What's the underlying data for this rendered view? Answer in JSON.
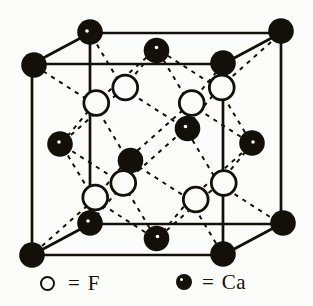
{
  "figure": {
    "name": "fluorite-CaF2-unit-cell",
    "background": "#fcfcfa",
    "ink": "#131009",
    "projection": {
      "origin_x": 32,
      "origin_y": 255,
      "edge": 191,
      "depth_dx": 58,
      "depth_dy": -31
    },
    "cube": {
      "stroke_width": 2.7,
      "edges": [
        [
          [
            0,
            0,
            0
          ],
          [
            1,
            0,
            0
          ]
        ],
        [
          [
            0,
            1,
            0
          ],
          [
            1,
            1,
            0
          ]
        ],
        [
          [
            0,
            0,
            0
          ],
          [
            0,
            1,
            0
          ]
        ],
        [
          [
            1,
            0,
            0
          ],
          [
            1,
            1,
            0
          ]
        ],
        [
          [
            0,
            0,
            1
          ],
          [
            1,
            0,
            1
          ]
        ],
        [
          [
            0,
            1,
            1
          ],
          [
            1,
            1,
            1
          ]
        ],
        [
          [
            0,
            0,
            1
          ],
          [
            0,
            1,
            1
          ]
        ],
        [
          [
            1,
            0,
            1
          ],
          [
            1,
            1,
            1
          ]
        ],
        [
          [
            0,
            0,
            0
          ],
          [
            0,
            0,
            1
          ]
        ],
        [
          [
            1,
            0,
            0
          ],
          [
            1,
            0,
            1
          ]
        ],
        [
          [
            0,
            1,
            0
          ],
          [
            0,
            1,
            1
          ]
        ],
        [
          [
            1,
            1,
            0
          ],
          [
            1,
            1,
            1
          ]
        ]
      ]
    },
    "bonds": {
      "stroke_width": 2,
      "dash": "4.2 5.2",
      "pairs": [
        [
          [
            0.25,
            0.25,
            0.25
          ],
          [
            0,
            0,
            0
          ]
        ],
        [
          [
            0.25,
            0.25,
            0.25
          ],
          [
            0.5,
            0.5,
            0
          ]
        ],
        [
          [
            0.25,
            0.25,
            0.25
          ],
          [
            0.5,
            0,
            0.5
          ]
        ],
        [
          [
            0.25,
            0.25,
            0.25
          ],
          [
            0,
            0.5,
            0.5
          ]
        ],
        [
          [
            0.75,
            0.25,
            0.25
          ],
          [
            1,
            0,
            0
          ]
        ],
        [
          [
            0.75,
            0.25,
            0.25
          ],
          [
            0.5,
            0.5,
            0
          ]
        ],
        [
          [
            0.75,
            0.25,
            0.25
          ],
          [
            0.5,
            0,
            0.5
          ]
        ],
        [
          [
            0.75,
            0.25,
            0.25
          ],
          [
            1,
            0.5,
            0.5
          ]
        ],
        [
          [
            0.25,
            0.75,
            0.25
          ],
          [
            0,
            1,
            0
          ]
        ],
        [
          [
            0.25,
            0.75,
            0.25
          ],
          [
            0.5,
            0.5,
            0
          ]
        ],
        [
          [
            0.25,
            0.75,
            0.25
          ],
          [
            0.5,
            1,
            0.5
          ]
        ],
        [
          [
            0.25,
            0.75,
            0.25
          ],
          [
            0,
            0.5,
            0.5
          ]
        ],
        [
          [
            0.75,
            0.75,
            0.25
          ],
          [
            1,
            1,
            0
          ]
        ],
        [
          [
            0.75,
            0.75,
            0.25
          ],
          [
            0.5,
            0.5,
            0
          ]
        ],
        [
          [
            0.75,
            0.75,
            0.25
          ],
          [
            0.5,
            1,
            0.5
          ]
        ],
        [
          [
            0.75,
            0.75,
            0.25
          ],
          [
            1,
            0.5,
            0.5
          ]
        ],
        [
          [
            0.25,
            0.25,
            0.75
          ],
          [
            0,
            0,
            1
          ]
        ],
        [
          [
            0.25,
            0.25,
            0.75
          ],
          [
            0.5,
            0.5,
            1
          ]
        ],
        [
          [
            0.25,
            0.25,
            0.75
          ],
          [
            0.5,
            0,
            0.5
          ]
        ],
        [
          [
            0.25,
            0.25,
            0.75
          ],
          [
            0,
            0.5,
            0.5
          ]
        ],
        [
          [
            0.75,
            0.25,
            0.75
          ],
          [
            1,
            0,
            1
          ]
        ],
        [
          [
            0.75,
            0.25,
            0.75
          ],
          [
            0.5,
            0.5,
            1
          ]
        ],
        [
          [
            0.75,
            0.25,
            0.75
          ],
          [
            0.5,
            0,
            0.5
          ]
        ],
        [
          [
            0.75,
            0.25,
            0.75
          ],
          [
            1,
            0.5,
            0.5
          ]
        ],
        [
          [
            0.25,
            0.75,
            0.75
          ],
          [
            0,
            1,
            1
          ]
        ],
        [
          [
            0.25,
            0.75,
            0.75
          ],
          [
            0.5,
            0.5,
            1
          ]
        ],
        [
          [
            0.25,
            0.75,
            0.75
          ],
          [
            0.5,
            1,
            0.5
          ]
        ],
        [
          [
            0.25,
            0.75,
            0.75
          ],
          [
            0,
            0.5,
            0.5
          ]
        ],
        [
          [
            0.75,
            0.75,
            0.75
          ],
          [
            1,
            1,
            1
          ]
        ],
        [
          [
            0.75,
            0.75,
            0.75
          ],
          [
            0.5,
            0.5,
            1
          ]
        ],
        [
          [
            0.75,
            0.75,
            0.75
          ],
          [
            0.5,
            1,
            0.5
          ]
        ],
        [
          [
            0.75,
            0.75,
            0.75
          ],
          [
            1,
            0.5,
            0.5
          ]
        ]
      ]
    },
    "atoms": {
      "ca": {
        "element": "Ca",
        "style": "filled",
        "radius": 12.8,
        "positions": [
          [
            0,
            0,
            0
          ],
          [
            1,
            0,
            0,
            0,
            -1
          ],
          [
            0,
            1,
            0,
            2,
            1
          ],
          [
            1,
            1,
            0,
            0,
            -1
          ],
          [
            0,
            0,
            1,
            0,
            -1,
            -2,
            -2
          ],
          [
            1,
            0,
            1,
            2,
            -1
          ],
          [
            0,
            1,
            1,
            0,
            -1,
            -3,
            -1
          ],
          [
            1,
            1,
            1,
            0,
            -2
          ],
          [
            0.5,
            0.5,
            0,
            3,
            1
          ],
          [
            0.5,
            0.5,
            1,
            2,
            0,
            -2,
            -2
          ],
          [
            0.5,
            1,
            0.5,
            0,
            2,
            0,
            -3
          ],
          [
            0.5,
            0,
            0.5,
            0,
            -1,
            1,
            -2
          ],
          [
            0,
            0.5,
            0.5,
            -1,
            0,
            -1,
            -2
          ],
          [
            1,
            0.5,
            0.5,
            0,
            -1,
            1,
            -1
          ]
        ]
      },
      "f": {
        "element": "F",
        "style": "open",
        "radius": 12.4,
        "stroke_width": 2.8,
        "positions": [
          [
            0.25,
            0.75,
            0.25,
            2,
            -1
          ],
          [
            0.75,
            0.75,
            0.25,
            2,
            -1
          ],
          [
            0.25,
            0.75,
            0.75,
            2,
            -1
          ],
          [
            0.75,
            0.75,
            0.75,
            3,
            -1
          ],
          [
            0.25,
            0.25,
            0.25,
            1,
            -2
          ],
          [
            0.75,
            0.25,
            0.25,
            6,
            0
          ],
          [
            0.25,
            0.25,
            0.75,
            0,
            -1
          ],
          [
            0.75,
            0.25,
            0.75,
            5,
            -1
          ]
        ]
      }
    }
  },
  "legend": {
    "f": {
      "symbol": "open-circle",
      "eq": "=",
      "label": "F"
    },
    "ca": {
      "symbol": "filled-circle",
      "eq": "=",
      "label": "Ca"
    }
  }
}
